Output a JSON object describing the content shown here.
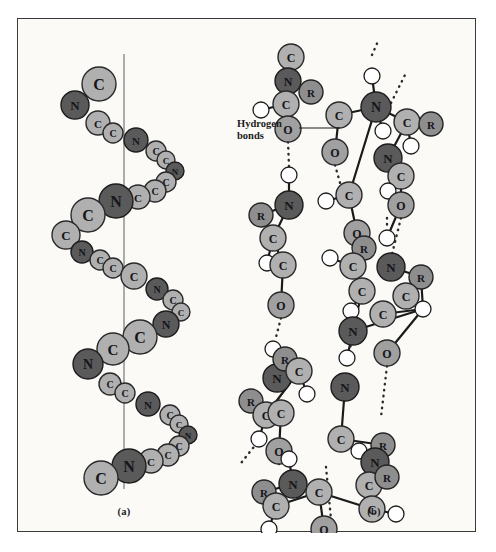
{
  "figure": {
    "background_color": "#fbfaf7",
    "frame_color": "#3a3a3a",
    "panels": [
      {
        "id": "a",
        "caption": "(a)",
        "structure": "alpha-helix"
      },
      {
        "id": "b",
        "caption": "(b)",
        "structure": "beta-pleated-sheet"
      }
    ]
  },
  "annotations": {
    "hydrogen_bonds_label_line1": "Hydrogen",
    "hydrogen_bonds_label_line2": "bonds",
    "leader_line": {
      "from_x": 281,
      "from_y": 109,
      "to_x": 322,
      "to_y": 109
    }
  },
  "atom_colors": {
    "carbon": "#b0b0b0",
    "carbon_stroke": "#2a2a2a",
    "nitrogen": "#5a5a5a",
    "nitrogen_stroke": "#1d1d1d",
    "oxygen": "#a0a0a0",
    "oxygen_stroke": "#2a2a2a",
    "r_group": "#8e8e8e",
    "r_group_stroke": "#242424",
    "hydrogen": "#ffffff",
    "hydrogen_stroke": "#1d1d1d",
    "bond": "#1a1a1a",
    "hbond": "#2a2a2a",
    "axis": "#6a6a6a"
  },
  "panel_a": {
    "caption": "(a)",
    "axis": {
      "x": 106,
      "y_top": 35,
      "y_bottom": 470
    },
    "atoms": [
      {
        "label": "C",
        "x": 81,
        "y": 65,
        "r": 17,
        "kind": "carbon"
      },
      {
        "label": "N",
        "x": 57,
        "y": 86,
        "r": 14,
        "kind": "nitrogen"
      },
      {
        "label": "C",
        "x": 80,
        "y": 104,
        "r": 12,
        "kind": "carbon"
      },
      {
        "label": "C",
        "x": 95,
        "y": 114,
        "r": 10,
        "kind": "carbon"
      },
      {
        "label": "N",
        "x": 118,
        "y": 121,
        "r": 12,
        "kind": "nitrogen"
      },
      {
        "label": "C",
        "x": 138,
        "y": 132,
        "r": 10,
        "kind": "carbon"
      },
      {
        "label": "C",
        "x": 148,
        "y": 141,
        "r": 9,
        "kind": "carbon"
      },
      {
        "label": "N",
        "x": 157,
        "y": 152,
        "r": 9,
        "kind": "nitrogen"
      },
      {
        "label": "C",
        "x": 148,
        "y": 163,
        "r": 10,
        "kind": "carbon"
      },
      {
        "label": "C",
        "x": 137,
        "y": 172,
        "r": 11,
        "kind": "carbon"
      },
      {
        "label": "C",
        "x": 120,
        "y": 178,
        "r": 12,
        "kind": "carbon"
      },
      {
        "label": "N",
        "x": 98,
        "y": 182,
        "r": 17,
        "kind": "nitrogen"
      },
      {
        "label": "C",
        "x": 70,
        "y": 196,
        "r": 17,
        "kind": "carbon"
      },
      {
        "label": "C",
        "x": 48,
        "y": 216,
        "r": 14,
        "kind": "carbon"
      },
      {
        "label": "N",
        "x": 64,
        "y": 233,
        "r": 11,
        "kind": "nitrogen"
      },
      {
        "label": "C",
        "x": 82,
        "y": 241,
        "r": 10,
        "kind": "carbon"
      },
      {
        "label": "C",
        "x": 95,
        "y": 249,
        "r": 10,
        "kind": "carbon"
      },
      {
        "label": "C",
        "x": 116,
        "y": 257,
        "r": 13,
        "kind": "carbon"
      },
      {
        "label": "N",
        "x": 139,
        "y": 270,
        "r": 11,
        "kind": "nitrogen"
      },
      {
        "label": "C",
        "x": 155,
        "y": 281,
        "r": 10,
        "kind": "carbon"
      },
      {
        "label": "C",
        "x": 163,
        "y": 293,
        "r": 9,
        "kind": "carbon"
      },
      {
        "label": "N",
        "x": 148,
        "y": 305,
        "r": 13,
        "kind": "nitrogen"
      },
      {
        "label": "C",
        "x": 122,
        "y": 318,
        "r": 17,
        "kind": "carbon"
      },
      {
        "label": "C",
        "x": 95,
        "y": 330,
        "r": 16,
        "kind": "carbon"
      },
      {
        "label": "N",
        "x": 70,
        "y": 345,
        "r": 15,
        "kind": "nitrogen"
      },
      {
        "label": "C",
        "x": 92,
        "y": 365,
        "r": 11,
        "kind": "carbon"
      },
      {
        "label": "C",
        "x": 107,
        "y": 374,
        "r": 10,
        "kind": "carbon"
      },
      {
        "label": "N",
        "x": 130,
        "y": 385,
        "r": 12,
        "kind": "nitrogen"
      },
      {
        "label": "C",
        "x": 152,
        "y": 396,
        "r": 10,
        "kind": "carbon"
      },
      {
        "label": "C",
        "x": 161,
        "y": 405,
        "r": 9,
        "kind": "carbon"
      },
      {
        "label": "N",
        "x": 170,
        "y": 416,
        "r": 9,
        "kind": "nitrogen"
      },
      {
        "label": "C",
        "x": 161,
        "y": 427,
        "r": 10,
        "kind": "carbon"
      },
      {
        "label": "C",
        "x": 150,
        "y": 436,
        "r": 11,
        "kind": "carbon"
      },
      {
        "label": "C",
        "x": 133,
        "y": 442,
        "r": 12,
        "kind": "carbon"
      },
      {
        "label": "N",
        "x": 111,
        "y": 447,
        "r": 17,
        "kind": "nitrogen"
      },
      {
        "label": "C",
        "x": 83,
        "y": 459,
        "r": 17,
        "kind": "carbon"
      }
    ]
  },
  "panel_b": {
    "caption": "(b)",
    "atoms": [
      {
        "label": "C",
        "x": 60,
        "y": 38,
        "r": 13,
        "kind": "carbon"
      },
      {
        "label": "N",
        "x": 57,
        "y": 62,
        "r": 13,
        "kind": "nitrogen"
      },
      {
        "label": "R",
        "x": 80,
        "y": 73,
        "r": 12,
        "kind": "r_group"
      },
      {
        "label": "C",
        "x": 55,
        "y": 85,
        "r": 13,
        "kind": "carbon"
      },
      {
        "label": "H",
        "x": 30,
        "y": 91,
        "r": 8,
        "kind": "hydrogen"
      },
      {
        "label": "O",
        "x": 57,
        "y": 110,
        "r": 13,
        "kind": "oxygen"
      },
      {
        "label": "H",
        "x": 58,
        "y": 156,
        "r": 8,
        "kind": "hydrogen"
      },
      {
        "label": "N",
        "x": 58,
        "y": 186,
        "r": 14,
        "kind": "nitrogen"
      },
      {
        "label": "R",
        "x": 30,
        "y": 196,
        "r": 12,
        "kind": "r_group"
      },
      {
        "label": "C",
        "x": 42,
        "y": 219,
        "r": 13,
        "kind": "carbon"
      },
      {
        "label": "H",
        "x": 36,
        "y": 244,
        "r": 8,
        "kind": "hydrogen"
      },
      {
        "label": "C",
        "x": 52,
        "y": 246,
        "r": 13,
        "kind": "carbon"
      },
      {
        "label": "O",
        "x": 50,
        "y": 286,
        "r": 13,
        "kind": "oxygen"
      },
      {
        "label": "H",
        "x": 42,
        "y": 330,
        "r": 8,
        "kind": "hydrogen"
      },
      {
        "label": "N",
        "x": 46,
        "y": 359,
        "r": 14,
        "kind": "nitrogen"
      },
      {
        "label": "R",
        "x": 54,
        "y": 340,
        "r": 12,
        "kind": "r_group"
      },
      {
        "label": "C",
        "x": 68,
        "y": 352,
        "r": 13,
        "kind": "carbon"
      },
      {
        "label": "H",
        "x": 76,
        "y": 375,
        "r": 8,
        "kind": "hydrogen"
      },
      {
        "label": "R",
        "x": 20,
        "y": 382,
        "r": 12,
        "kind": "r_group"
      },
      {
        "label": "C",
        "x": 35,
        "y": 396,
        "r": 13,
        "kind": "carbon"
      },
      {
        "label": "H",
        "x": 28,
        "y": 420,
        "r": 8,
        "kind": "hydrogen"
      },
      {
        "label": "C",
        "x": 50,
        "y": 394,
        "r": 13,
        "kind": "carbon"
      },
      {
        "label": "O",
        "x": 48,
        "y": 432,
        "r": 13,
        "kind": "oxygen"
      },
      {
        "label": "H",
        "x": 58,
        "y": 440,
        "r": 8,
        "kind": "hydrogen"
      },
      {
        "label": "N",
        "x": 62,
        "y": 465,
        "r": 14,
        "kind": "nitrogen"
      },
      {
        "label": "R",
        "x": 33,
        "y": 473,
        "r": 12,
        "kind": "r_group"
      },
      {
        "label": "C",
        "x": 45,
        "y": 487,
        "r": 13,
        "kind": "carbon"
      },
      {
        "label": "H",
        "x": 38,
        "y": 510,
        "r": 8,
        "kind": "hydrogen"
      },
      {
        "label": "C",
        "x": 88,
        "y": 473,
        "r": 13,
        "kind": "carbon"
      },
      {
        "label": "O",
        "x": 93,
        "y": 510,
        "r": 13,
        "kind": "oxygen"
      },
      {
        "label": "C",
        "x": 108,
        "y": 96,
        "r": 13,
        "kind": "carbon"
      },
      {
        "label": "O",
        "x": 104,
        "y": 133,
        "r": 13,
        "kind": "oxygen"
      },
      {
        "label": "C",
        "x": 118,
        "y": 176,
        "r": 13,
        "kind": "carbon"
      },
      {
        "label": "H",
        "x": 95,
        "y": 182,
        "r": 8,
        "kind": "hydrogen"
      },
      {
        "label": "O",
        "x": 126,
        "y": 214,
        "r": 13,
        "kind": "oxygen"
      },
      {
        "label": "R",
        "x": 133,
        "y": 229,
        "r": 12,
        "kind": "r_group"
      },
      {
        "label": "C",
        "x": 122,
        "y": 247,
        "r": 13,
        "kind": "carbon"
      },
      {
        "label": "H",
        "x": 99,
        "y": 239,
        "r": 8,
        "kind": "hydrogen"
      },
      {
        "label": "C",
        "x": 131,
        "y": 272,
        "r": 13,
        "kind": "carbon"
      },
      {
        "label": "H",
        "x": 120,
        "y": 292,
        "r": 8,
        "kind": "hydrogen"
      },
      {
        "label": "N",
        "x": 122,
        "y": 312,
        "r": 14,
        "kind": "nitrogen"
      },
      {
        "label": "H",
        "x": 116,
        "y": 339,
        "r": 8,
        "kind": "hydrogen"
      },
      {
        "label": "N",
        "x": 114,
        "y": 368,
        "r": 14,
        "kind": "nitrogen"
      },
      {
        "label": "C",
        "x": 110,
        "y": 420,
        "r": 13,
        "kind": "carbon"
      },
      {
        "label": "H",
        "x": 128,
        "y": 432,
        "r": 8,
        "kind": "hydrogen"
      },
      {
        "label": "R",
        "x": 152,
        "y": 426,
        "r": 12,
        "kind": "r_group"
      },
      {
        "label": "N",
        "x": 144,
        "y": 443,
        "r": 14,
        "kind": "nitrogen"
      },
      {
        "label": "C",
        "x": 138,
        "y": 466,
        "r": 13,
        "kind": "carbon"
      },
      {
        "label": "R",
        "x": 156,
        "y": 458,
        "r": 12,
        "kind": "r_group"
      },
      {
        "label": "C",
        "x": 141,
        "y": 490,
        "r": 13,
        "kind": "carbon"
      },
      {
        "label": "H",
        "x": 165,
        "y": 495,
        "r": 8,
        "kind": "hydrogen"
      },
      {
        "label": "H",
        "x": 141,
        "y": 57,
        "r": 8,
        "kind": "hydrogen"
      },
      {
        "label": "N",
        "x": 145,
        "y": 88,
        "r": 15,
        "kind": "nitrogen"
      },
      {
        "label": "H",
        "x": 152,
        "y": 112,
        "r": 8,
        "kind": "hydrogen"
      },
      {
        "label": "C",
        "x": 176,
        "y": 103,
        "r": 13,
        "kind": "carbon"
      },
      {
        "label": "R",
        "x": 200,
        "y": 105,
        "r": 12,
        "kind": "r_group"
      },
      {
        "label": "H",
        "x": 180,
        "y": 127,
        "r": 8,
        "kind": "hydrogen"
      },
      {
        "label": "N",
        "x": 157,
        "y": 139,
        "r": 14,
        "kind": "nitrogen"
      },
      {
        "label": "C",
        "x": 170,
        "y": 157,
        "r": 13,
        "kind": "carbon"
      },
      {
        "label": "H",
        "x": 157,
        "y": 172,
        "r": 8,
        "kind": "hydrogen"
      },
      {
        "label": "O",
        "x": 170,
        "y": 186,
        "r": 13,
        "kind": "oxygen"
      },
      {
        "label": "H",
        "x": 156,
        "y": 219,
        "r": 8,
        "kind": "hydrogen"
      },
      {
        "label": "N",
        "x": 160,
        "y": 248,
        "r": 14,
        "kind": "nitrogen"
      },
      {
        "label": "R",
        "x": 190,
        "y": 258,
        "r": 12,
        "kind": "r_group"
      },
      {
        "label": "C",
        "x": 175,
        "y": 277,
        "r": 13,
        "kind": "carbon"
      },
      {
        "label": "H",
        "x": 192,
        "y": 290,
        "r": 8,
        "kind": "hydrogen"
      },
      {
        "label": "C",
        "x": 152,
        "y": 295,
        "r": 13,
        "kind": "carbon"
      },
      {
        "label": "O",
        "x": 156,
        "y": 334,
        "r": 13,
        "kind": "oxygen"
      }
    ],
    "hydrogen_bond_count": 8
  }
}
